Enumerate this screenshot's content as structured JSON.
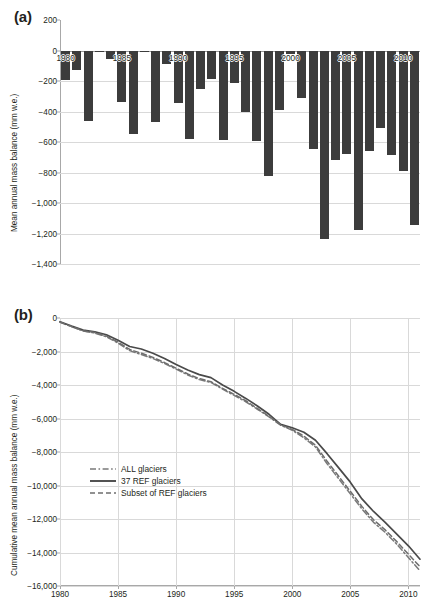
{
  "figure": {
    "panel_a_label": "(a)",
    "panel_b_label": "(b)"
  },
  "panel_a": {
    "ylabel": "Mean annual mass balance (mm w.e.)",
    "yticks": [
      "200",
      "0",
      "−200",
      "−400",
      "−600",
      "−800",
      "−1,000",
      "−1,200",
      "−1,400"
    ],
    "xticks": [
      "1980",
      "1985",
      "1990",
      "1995",
      "2000",
      "2005",
      "2010"
    ],
    "bar_color": "#3c3c3c"
  },
  "panel_b": {
    "ylabel": "Cumulative mean annual mass balance (mm w.e.)",
    "yticks": [
      "0",
      "−2,000",
      "−4,000",
      "−6,000",
      "−8,000",
      "−10,000",
      "−12,000",
      "−14,000",
      "−16,000"
    ],
    "xticks": [
      "1980",
      "1985",
      "1990",
      "1995",
      "2000",
      "2005",
      "2010"
    ],
    "legend": [
      {
        "label": "ALL glaciers",
        "style": "dashdot",
        "color": "#7a7a7a"
      },
      {
        "label": "37 REF glaciers",
        "style": "solid",
        "color": "#4a4a4a"
      },
      {
        "label": "Subset of REF glaciers",
        "style": "dashed",
        "color": "#6e6e6e"
      }
    ]
  },
  "chart_data": [
    {
      "type": "bar",
      "title": "(a) Mean annual mass balance",
      "xlabel": "",
      "ylabel": "Mean annual mass balance (mm w.e.)",
      "ylim": [
        -1400,
        200
      ],
      "xlim": [
        1979.5,
        2011.5
      ],
      "grid": true,
      "legend": "none",
      "categories": [
        1980,
        1981,
        1982,
        1983,
        1984,
        1985,
        1986,
        1987,
        1988,
        1989,
        1990,
        1991,
        1992,
        1993,
        1994,
        1995,
        1996,
        1997,
        1998,
        1999,
        2000,
        2001,
        2002,
        2003,
        2004,
        2005,
        2006,
        2007,
        2008,
        2009,
        2010,
        2011
      ],
      "values": [
        -195,
        -130,
        -460,
        -10,
        -55,
        -340,
        -545,
        -8,
        -470,
        -90,
        -345,
        -580,
        -255,
        -185,
        -590,
        -215,
        -400,
        -595,
        -820,
        -390,
        -25,
        -310,
        -645,
        -1235,
        -715,
        -680,
        -1180,
        -660,
        -505,
        -685,
        -790,
        -1145
      ],
      "series": [
        {
          "name": "Mean annual mass balance",
          "values": [
            -195,
            -130,
            -460,
            -10,
            -55,
            -340,
            -545,
            -8,
            -470,
            -90,
            -345,
            -580,
            -255,
            -185,
            -590,
            -215,
            -400,
            -595,
            -820,
            -390,
            -25,
            -310,
            -645,
            -1235,
            -715,
            -680,
            -1180,
            -660,
            -505,
            -685,
            -790,
            -1145
          ]
        }
      ]
    },
    {
      "type": "line",
      "title": "(b) Cumulative mean annual mass balance",
      "xlabel": "",
      "ylabel": "Cumulative mean annual mass balance (mm w.e.)",
      "ylim": [
        -16000,
        0
      ],
      "xlim": [
        1980,
        2011
      ],
      "grid": true,
      "legend": "inside-left",
      "x": [
        1980,
        1981,
        1982,
        1983,
        1984,
        1985,
        1986,
        1987,
        1988,
        1989,
        1990,
        1991,
        1992,
        1993,
        1994,
        1995,
        1996,
        1997,
        1998,
        1999,
        2000,
        2001,
        2002,
        2003,
        2004,
        2005,
        2006,
        2007,
        2008,
        2009,
        2010,
        2011
      ],
      "series": [
        {
          "name": "ALL glaciers",
          "style": "dashdot",
          "values": [
            -250,
            -520,
            -780,
            -900,
            -1120,
            -1500,
            -1950,
            -2180,
            -2420,
            -2720,
            -3050,
            -3400,
            -3680,
            -3850,
            -4250,
            -4620,
            -5000,
            -5450,
            -5900,
            -6400,
            -6700,
            -7150,
            -7700,
            -8700,
            -9600,
            -10500,
            -11400,
            -12200,
            -12800,
            -13500,
            -14300,
            -15100
          ]
        },
        {
          "name": "37 REF glaciers",
          "style": "solid",
          "values": [
            -220,
            -480,
            -720,
            -820,
            -1000,
            -1330,
            -1700,
            -1850,
            -2100,
            -2420,
            -2780,
            -3100,
            -3380,
            -3560,
            -4000,
            -4380,
            -4800,
            -5250,
            -5750,
            -6350,
            -6550,
            -6820,
            -7300,
            -8100,
            -8950,
            -9800,
            -10800,
            -11550,
            -12200,
            -12900,
            -13600,
            -14400
          ]
        },
        {
          "name": "Subset of REF glaciers",
          "style": "dashed",
          "values": [
            -240,
            -510,
            -760,
            -870,
            -1080,
            -1440,
            -1880,
            -2100,
            -2350,
            -2660,
            -3000,
            -3340,
            -3620,
            -3800,
            -4200,
            -4560,
            -4940,
            -5400,
            -5870,
            -6380,
            -6650,
            -7050,
            -7600,
            -8550,
            -9450,
            -10350,
            -11250,
            -12050,
            -12650,
            -13350,
            -14100,
            -14850
          ]
        }
      ]
    }
  ]
}
